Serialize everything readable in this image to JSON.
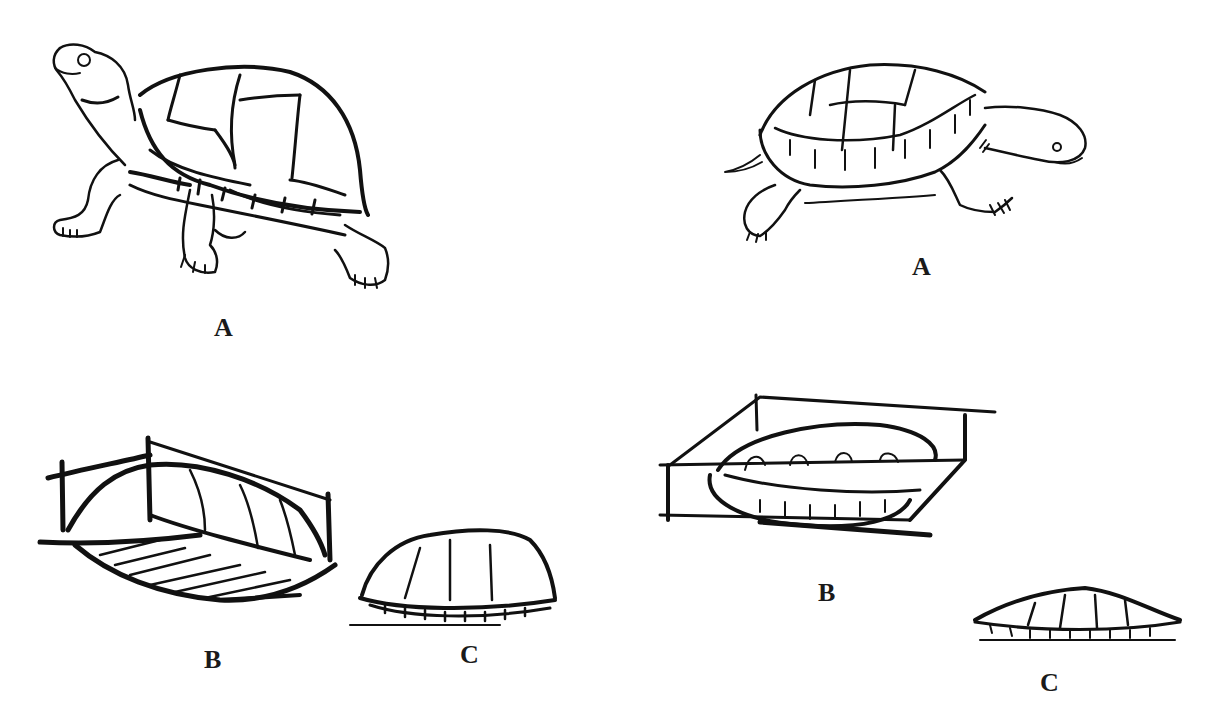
{
  "figure": {
    "left_column": {
      "turtle_side_view": {
        "label": "A"
      },
      "shell_box_view": {
        "label": "B"
      },
      "shell_profile": {
        "label": "C"
      }
    },
    "right_column": {
      "turtle_side_view": {
        "label": "A"
      },
      "shell_box_view": {
        "label": "B"
      },
      "shell_profile": {
        "label": "C"
      }
    }
  }
}
